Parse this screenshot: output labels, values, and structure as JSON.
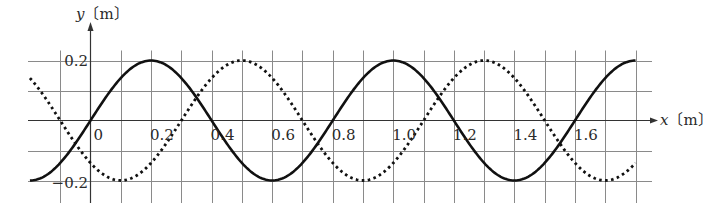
{
  "chart_data": {
    "type": "line",
    "title": "",
    "xlabel": "x〔m〕",
    "ylabel": "y〔m〕",
    "xlim": [
      -0.2,
      1.8
    ],
    "ylim": [
      -0.2,
      0.2
    ],
    "grid": true,
    "grid_step_x": 0.1,
    "grid_step_y": 0.1,
    "x_tick_labels": [
      "0",
      "0.2",
      "0.4",
      "0.6",
      "0.8",
      "1.0",
      "1.2",
      "1.4",
      "1.6"
    ],
    "y_tick_labels": [
      "0.2",
      "−0.2"
    ],
    "series": [
      {
        "name": "solid wave",
        "style": "solid",
        "amplitude": 0.2,
        "wavelength": 0.8,
        "x": [
          -0.2,
          0.0,
          0.2,
          0.4,
          0.6,
          0.8,
          1.0,
          1.2,
          1.4,
          1.6,
          1.8
        ],
        "y": [
          -0.2,
          0.0,
          0.2,
          0.0,
          -0.2,
          0.0,
          0.2,
          0.0,
          -0.2,
          0.0,
          0.2
        ]
      },
      {
        "name": "dotted wave",
        "style": "dotted",
        "amplitude": 0.2,
        "wavelength": 0.8,
        "x": [
          -0.2,
          -0.1,
          0.1,
          0.3,
          0.5,
          0.7,
          0.9,
          1.1,
          1.3,
          1.5,
          1.7,
          1.8
        ],
        "y": [
          0.14,
          0.0,
          -0.2,
          0.0,
          0.2,
          0.0,
          -0.2,
          0.0,
          0.2,
          0.0,
          -0.2,
          -0.14
        ]
      }
    ]
  },
  "axes": {
    "x_label_var": "x",
    "x_label_unit": "〔m〕",
    "y_label_var": "y",
    "y_label_unit": "〔m〕"
  }
}
